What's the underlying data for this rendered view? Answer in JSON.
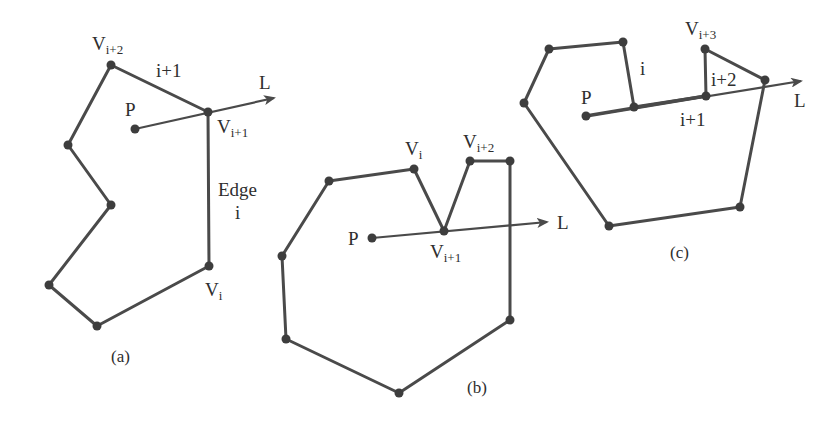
{
  "colors": {
    "background": "#ffffff",
    "stroke": "#4a4a4a",
    "vertex": "#3d3d3d",
    "text": "#2e2e2e"
  },
  "panels": [
    {
      "caption": "(a)",
      "point_label": "P",
      "ray_label": "L",
      "labels": {
        "v_i2_main": "V",
        "v_i2_sub": "i+2",
        "v_i1_main": "V",
        "v_i1_sub": "i+1",
        "v_i_main": "V",
        "v_i_sub": "i",
        "edge_i1": "i+1",
        "edge_word": "Edge",
        "edge_i": "i"
      }
    },
    {
      "caption": "(b)",
      "point_label": "P",
      "ray_label": "L",
      "labels": {
        "v_i_main": "V",
        "v_i_sub": "i",
        "v_i1_main": "V",
        "v_i1_sub": "i+1",
        "v_i2_main": "V",
        "v_i2_sub": "i+2"
      }
    },
    {
      "caption": "(c)",
      "point_label": "P",
      "ray_label": "L",
      "labels": {
        "v_i3_main": "V",
        "v_i3_sub": "i+3",
        "edge_i": "i",
        "edge_i1": "i+1",
        "edge_i2": "i+2"
      }
    }
  ]
}
